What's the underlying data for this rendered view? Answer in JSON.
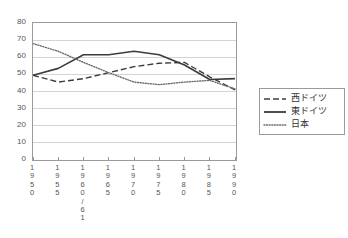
{
  "chart_data": {
    "type": "line",
    "title": "",
    "subtitle": "",
    "xlabel": "",
    "ylabel": "",
    "grid": true,
    "legend_position": "right",
    "categories": [
      "1950",
      "1955",
      "1960/61",
      "1965",
      "1970",
      "1975",
      "1980",
      "1985",
      "1990"
    ],
    "xtick_labels": [
      "1\n9\n5\n0",
      "1\n9\n5\n5",
      "1\n9\n6\n0\n/\n6\n1",
      "1\n9\n6\n5",
      "1\n9\n7\n0",
      "1\n9\n7\n5",
      "1\n9\n8\n0",
      "1\n9\n8\n5",
      "1\n9\n9\n0"
    ],
    "ylim": [
      0,
      80
    ],
    "ytick_values": [
      0,
      10,
      20,
      30,
      40,
      50,
      60,
      70,
      80
    ],
    "ytick_labels": [
      "0",
      "10",
      "20",
      "30",
      "40",
      "50",
      "60",
      "70",
      "80"
    ],
    "series": [
      {
        "name": "西ドイツ",
        "style": "dashed",
        "color": "#3c3c3c",
        "values": [
          49.5,
          45.5,
          47.5,
          51.0,
          54.5,
          56.5,
          57.0,
          48.5,
          41.0
        ]
      },
      {
        "name": "東ドイツ",
        "style": "solid",
        "color": "#3c3c3c",
        "values": [
          49.5,
          53.5,
          61.5,
          61.5,
          63.5,
          61.5,
          55.5,
          47.0,
          47.5
        ]
      },
      {
        "name": "日本",
        "style": "dotted",
        "color": "#6a6a6a",
        "values": [
          68.0,
          63.5,
          57.0,
          51.0,
          45.5,
          44.0,
          45.5,
          46.5,
          41.5
        ]
      }
    ]
  },
  "legend": {
    "items": [
      {
        "label": "西ドイツ",
        "style": "dashed"
      },
      {
        "label": "東ドイツ",
        "style": "solid"
      },
      {
        "label": "日本",
        "style": "dotted"
      }
    ]
  },
  "colors": {
    "frame": "#9a9a9a",
    "gridline": "#d4d4d4",
    "text": "#555555",
    "series_solid": "#3c3c3c",
    "series_dashed": "#3c3c3c",
    "series_dotted": "#6a6a6a",
    "background": "#ffffff"
  }
}
